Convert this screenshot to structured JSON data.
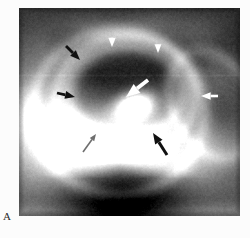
{
  "figure": {
    "part_label": "A",
    "modality": "radiograph",
    "panel": {
      "x": 19,
      "y": 8,
      "width": 221,
      "height": 208
    },
    "background_color": "#ffffff",
    "film_border_color": "#c9c9c9"
  },
  "annotations": {
    "arrows": [
      {
        "id": "arrow-white-top-left",
        "color": "#ffffff",
        "kind": "white-arrow",
        "direction": "down",
        "x": 112,
        "y": 38,
        "length": 15,
        "head": 6.0,
        "shaft": 2.6,
        "tip_x": 112,
        "tip_y": 47
      },
      {
        "id": "arrow-white-top-right",
        "color": "#ffffff",
        "kind": "white-arrow",
        "direction": "down",
        "x": 158,
        "y": 44,
        "length": 14,
        "head": 5.6,
        "shaft": 2.4,
        "tip_x": 158,
        "tip_y": 53
      },
      {
        "id": "arrow-white-center",
        "color": "#ffffff",
        "kind": "white-arrow-large",
        "direction": "down-left",
        "x": 148,
        "y": 80,
        "length": 26,
        "head": 9.0,
        "shaft": 3.8,
        "tip_x": 126,
        "tip_y": 97
      },
      {
        "id": "arrow-white-right",
        "color": "#ffffff",
        "kind": "white-arrow",
        "direction": "left",
        "x": 218,
        "y": 96,
        "length": 17,
        "head": 6.2,
        "shaft": 2.6,
        "tip_x": 201,
        "tip_y": 96
      },
      {
        "id": "arrow-black-upper-left",
        "color": "#101010",
        "kind": "black-arrow",
        "direction": "down-right",
        "x": 66,
        "y": 46,
        "length": 17,
        "head": 6.4,
        "shaft": 2.8,
        "tip_x": 80,
        "tip_y": 60
      },
      {
        "id": "arrow-black-mid-left",
        "color": "#101010",
        "kind": "black-arrow",
        "direction": "right",
        "x": 57,
        "y": 93,
        "length": 18,
        "head": 6.4,
        "shaft": 2.8,
        "tip_x": 75,
        "tip_y": 97
      },
      {
        "id": "arrow-black-lower",
        "color": "#101010",
        "kind": "black-arrow",
        "direction": "up-left",
        "x": 167,
        "y": 155,
        "length": 24,
        "head": 7.0,
        "shaft": 3.0,
        "tip_x": 153,
        "tip_y": 133
      },
      {
        "id": "arrow-grey-lower-left",
        "color": "#6e6e6e",
        "kind": "grey-arrow-thin",
        "direction": "up-right",
        "x": 83,
        "y": 152,
        "length": 21,
        "head": 4.4,
        "shaft": 1.6,
        "tip_x": 96,
        "tip_y": 134
      }
    ]
  },
  "chart_data": {
    "type": "heatmap",
    "xlabel": "",
    "ylabel": ""
  }
}
